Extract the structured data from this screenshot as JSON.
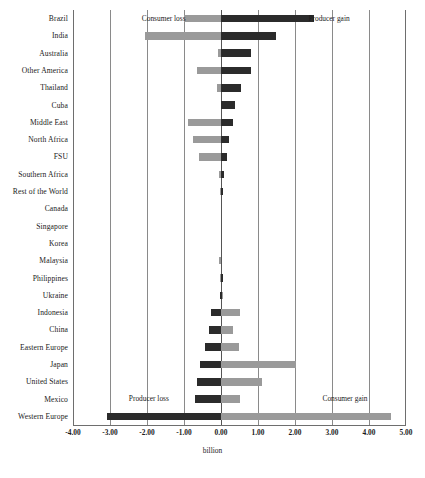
{
  "chart_data": {
    "type": "bar",
    "title": "",
    "xlabel": "billion",
    "ylabel": "",
    "orientation": "horizontal",
    "stacked_from_zero": true,
    "xlim": [
      -4.0,
      5.0
    ],
    "xticks": [
      "-4.00",
      "-3.00",
      "-2.00",
      "-1.00",
      "0.00",
      "1.00",
      "2.00",
      "3.00",
      "4.00",
      "5.00"
    ],
    "xtick_values": [
      -4,
      -3,
      -2,
      -1,
      0,
      1,
      2,
      3,
      4,
      5
    ],
    "grid": true,
    "legend": "none",
    "categories": [
      "Brazil",
      "India",
      "Australia",
      "Other America",
      "Thailand",
      "Cuba",
      "Middle East",
      "North Africa",
      "FSU",
      "Southern Africa",
      "Rest of the World",
      "Canada",
      "Singapore",
      "Korea",
      "Malaysia",
      "Philippines",
      "Ukraine",
      "Indonesia",
      "China",
      "Eastern Europe",
      "Japan",
      "United States",
      "Mexico",
      "Western Europe"
    ],
    "series": [
      {
        "name": "consumer",
        "color": "#9a9a9a",
        "values": [
          -1.0,
          -2.05,
          -0.08,
          -0.65,
          -0.12,
          0.0,
          -0.88,
          -0.75,
          -0.6,
          -0.05,
          -0.03,
          0.0,
          0.0,
          0.0,
          -0.06,
          -0.02,
          0.02,
          0.52,
          0.32,
          0.48,
          2.02,
          1.12,
          0.5,
          4.6
        ]
      },
      {
        "name": "producer",
        "color": "#2b2b2b",
        "values": [
          2.52,
          1.48,
          0.8,
          0.82,
          0.55,
          0.38,
          0.32,
          0.22,
          0.15,
          0.08,
          0.04,
          0.0,
          0.0,
          0.0,
          0.0,
          0.02,
          -0.04,
          -0.28,
          -0.32,
          -0.42,
          -0.58,
          -0.65,
          -0.7,
          -3.07
        ]
      }
    ],
    "annotations": [
      {
        "text": "Consumer loss",
        "x": -1.55,
        "row": 0,
        "align": "center"
      },
      {
        "text": "Producer gain",
        "x": 2.92,
        "row": 0,
        "align": "center"
      },
      {
        "text": "Producer loss",
        "x": -1.95,
        "row": 22,
        "align": "center"
      },
      {
        "text": "Consumer gain",
        "x": 3.35,
        "row": 22,
        "align": "center"
      }
    ]
  }
}
